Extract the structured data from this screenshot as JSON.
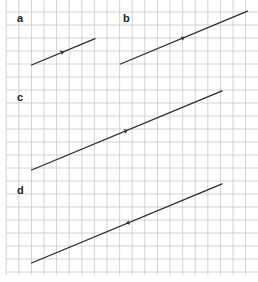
{
  "figure": {
    "type": "vectors-on-square-grid",
    "grid_color": "#c8c8c8",
    "line_color": "#2a2a2a",
    "panels": [
      {
        "label": "a",
        "start": [
          2,
          0
        ],
        "end": [
          7,
          2
        ],
        "arrow_direction": "forward"
      },
      {
        "label": "b",
        "start": [
          9,
          0
        ],
        "end": [
          19,
          4
        ],
        "arrow_direction": "forward"
      },
      {
        "label": "c",
        "start": [
          2,
          0
        ],
        "end": [
          17,
          6
        ],
        "arrow_direction": "forward"
      },
      {
        "label": "d",
        "start": [
          2,
          0
        ],
        "end": [
          17,
          6
        ],
        "arrow_direction": "backward"
      }
    ]
  }
}
